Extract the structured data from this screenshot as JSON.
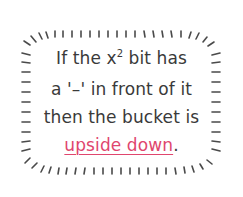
{
  "note": {
    "line1_pre": "If the x",
    "line1_sup": "2",
    "line1_post": " bit has",
    "line2": "a '–' in front of it",
    "line3": "then the bucket is",
    "line4_highlight": "upside down",
    "line4_post": "."
  },
  "colors": {
    "text": "#3a3a3a",
    "highlight": "#e0466e",
    "ticks": "#4a4a4a",
    "background": "#ffffff"
  },
  "icons": {
    "border": "tick-mark-border"
  }
}
